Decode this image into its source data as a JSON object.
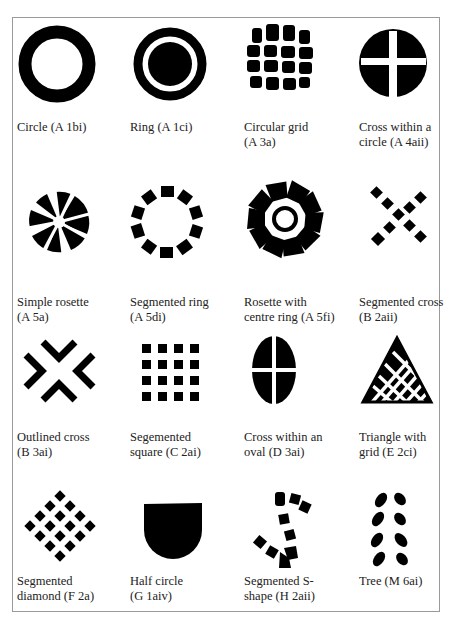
{
  "figure": {
    "items": [
      {
        "label": "Circle (A 1bi)",
        "code": "A 1bi",
        "icon": "circle-icon"
      },
      {
        "label": "Ring (A 1ci)",
        "code": "A 1ci",
        "icon": "ring-icon"
      },
      {
        "label": "Circular grid\n (A 3a)",
        "code": "A 3a",
        "icon": "circular-grid-icon"
      },
      {
        "label": "Cross within a\ncircle (A 4aii)",
        "code": "A 4aii",
        "icon": "cross-in-circle-icon"
      },
      {
        "label": "Simple rosette\n(A 5a)",
        "code": "A 5a",
        "icon": "simple-rosette-icon"
      },
      {
        "label": "Segmented ring\n(A 5di)",
        "code": "A 5di",
        "icon": "segmented-ring-icon"
      },
      {
        "label": "Rosette with\ncentre ring (A 5fi)",
        "code": "A 5fi",
        "icon": "rosette-centre-ring-icon"
      },
      {
        "label": "Segmented cross\n(B 2aii)",
        "code": "B 2aii",
        "icon": "segmented-cross-icon"
      },
      {
        "label": "Outlined cross\n (B 3ai)",
        "code": "B 3ai",
        "icon": "outlined-cross-icon"
      },
      {
        "label": "Segemented\nsquare (C 2ai)",
        "code": "C 2ai",
        "icon": "segmented-square-icon"
      },
      {
        "label": "Cross within an\noval (D 3ai)",
        "code": "D 3ai",
        "icon": "cross-in-oval-icon"
      },
      {
        "label": "Triangle with\ngrid (E 2ci)",
        "code": "E 2ci",
        "icon": "triangle-grid-icon"
      },
      {
        "label": "Segmented\ndiamond (F 2a)",
        "code": "F 2a",
        "icon": "segmented-diamond-icon"
      },
      {
        "label": "Half circle\n(G 1aiv)",
        "code": "G 1aiv",
        "icon": "half-circle-icon"
      },
      {
        "label": "Segmented S-\nshape (H 2aii)",
        "code": "H 2aii",
        "icon": "segmented-s-shape-icon"
      },
      {
        "label": "Tree (M 6ai)",
        "code": "M 6ai",
        "icon": "tree-icon"
      }
    ]
  },
  "colors": {
    "ink": "#000000",
    "border": "#9a9a9a",
    "background": "#ffffff"
  }
}
